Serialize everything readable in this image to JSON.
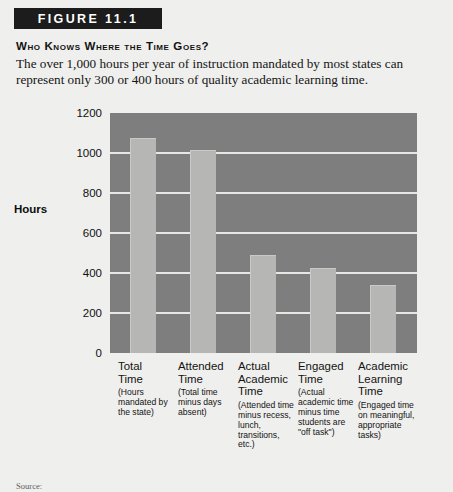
{
  "figure": {
    "banner_label": "FIGURE 11.1",
    "headline": "Who Knows Where the Time Goes?",
    "deck": "The over 1,000 hours per year of instruction mandated by most states can represent only 300 or 400 hours of quality academic learning time.",
    "source": "Source:"
  },
  "colors": {
    "page_background": "#efefed",
    "banner_background": "#1c1c1c",
    "banner_text": "#ffffff",
    "plot_background": "#7e7e7e",
    "bar_fill": "#b6b6b4",
    "gridline": "#e7e7e5",
    "text": "#121212"
  },
  "chart_data": {
    "type": "bar",
    "title": "Who Knows Where the Time Goes?",
    "xlabel": "",
    "ylabel": "Hours",
    "ylim": [
      0,
      1200
    ],
    "yticks": [
      0,
      200,
      400,
      600,
      800,
      1000,
      1200
    ],
    "grid": true,
    "legend": "none",
    "categories": [
      "Total Time",
      "Attended Time",
      "Actual Academic Time",
      "Engaged Time",
      "Academic Learning Time"
    ],
    "values": [
      1075,
      1015,
      490,
      425,
      340
    ],
    "bars": [
      {
        "name_lines": [
          "Total",
          "Time"
        ],
        "note": "(Hours mandated by the state)",
        "value": 1075
      },
      {
        "name_lines": [
          "Attended",
          "Time"
        ],
        "note": "(Total time minus days absent)",
        "value": 1015
      },
      {
        "name_lines": [
          "Actual",
          "Academic",
          "Time"
        ],
        "note": "(Attended time minus recess, lunch, transitions, etc.)",
        "value": 490
      },
      {
        "name_lines": [
          "Engaged",
          "Time"
        ],
        "note": "(Actual academic time minus time students are \"off task\")",
        "value": 425
      },
      {
        "name_lines": [
          "Academic",
          "Learning",
          "Time"
        ],
        "note": "(Engaged time on meaningful, appropriate tasks)",
        "value": 340
      }
    ]
  }
}
